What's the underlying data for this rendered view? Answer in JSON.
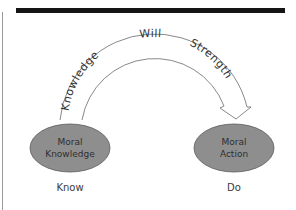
{
  "arc": {
    "labels": {
      "left": "Knowledge",
      "top": "Will",
      "right": "Strength"
    }
  },
  "nodes": [
    {
      "id": "moral-knowledge",
      "line1": "Moral",
      "line2": "Knowledge",
      "caption": "Know"
    },
    {
      "id": "moral-action",
      "line1": "Moral",
      "line2": "Action",
      "caption": "Do"
    }
  ],
  "colors": {
    "node_fill": "#8e8e8e",
    "node_stroke": "#5a5a5a",
    "bar": "#151515",
    "arc_stroke": "#6a6a6a"
  }
}
